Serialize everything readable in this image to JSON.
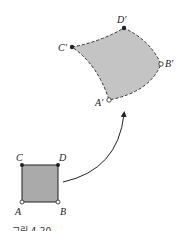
{
  "diagram": {
    "source_region": {
      "shape": "square",
      "fill": "#aaaaaa",
      "vertices": {
        "A": "A",
        "B": "B",
        "C": "C",
        "D": "D"
      }
    },
    "image_region": {
      "shape": "curved quadrilateral (dashed boundary)",
      "fill": "#c4c4c4",
      "vertices": {
        "A": "A′",
        "B": "B′",
        "C": "C′",
        "D": "D′"
      }
    },
    "mapping_arrow": "curved arrow from square to image region",
    "caption": "그림 4-20"
  }
}
